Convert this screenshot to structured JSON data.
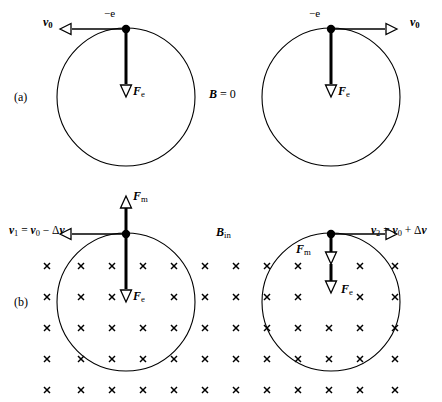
{
  "figure": {
    "width": 442,
    "height": 402,
    "background": "#ffffff",
    "stroke": "#000000",
    "panels": [
      {
        "tag": "(a)",
        "field_label": "B = 0",
        "description": "No magnetic field; electron orbits with speed v0 under electric force Fe only."
      },
      {
        "tag": "(b)",
        "field_label": "B_in",
        "description": "Magnetic field into the page; magnetic force Fm adds to or subtracts from the electric force Fe, changing the orbital speed."
      }
    ]
  },
  "labels": {
    "panel_a_tag": "(a)",
    "panel_b_tag": "(b)",
    "charge_left_a": "−e",
    "charge_right_a": "−e",
    "velocity_left_a": "v",
    "velocity_left_a_sub": "0",
    "velocity_right_a": "v",
    "velocity_right_a_sub": "0",
    "force_e_left_a": "F",
    "force_e_left_a_sub": "e",
    "force_e_right_a": "F",
    "force_e_right_a_sub": "e",
    "field_a": "B",
    "field_a_value": " = 0",
    "field_b": "B",
    "field_b_sub": "in",
    "force_m_left_b": "F",
    "force_m_left_b_sub": "m",
    "force_m_right_b": "F",
    "force_m_right_b_sub": "m",
    "force_e_left_b": "F",
    "force_e_left_b_sub": "e",
    "force_e_right_b": "F",
    "force_e_right_b_sub": "e",
    "velocity_left_b_name": "v",
    "velocity_left_b_sub": "1",
    "velocity_left_b_rhs": " = ",
    "velocity_left_b_v0": "v",
    "velocity_left_b_v0_sub": "0",
    "velocity_left_b_op": " − Δ",
    "velocity_left_b_dv": "v",
    "velocity_right_b_name": "v",
    "velocity_right_b_sub": "2",
    "velocity_right_b_rhs": " = ",
    "velocity_right_b_v0": "v",
    "velocity_right_b_v0_sub": "0",
    "velocity_right_b_op": " + Δ",
    "velocity_right_b_dv": "v",
    "field_cross_glyph": "×"
  },
  "geometry": {
    "circle_a_left": {
      "cx": 126,
      "cy": 97,
      "r": 69
    },
    "circle_a_right": {
      "cx": 331,
      "cy": 97,
      "r": 69
    },
    "circle_b_left": {
      "cx": 126,
      "cy": 302,
      "r": 69
    },
    "circle_b_right": {
      "cx": 331,
      "cy": 302,
      "r": 69
    },
    "cross_rows_y": [
      266,
      297,
      328,
      359,
      390
    ],
    "cross_cols_x": [
      47,
      81,
      112,
      143,
      174,
      205,
      236,
      267,
      298,
      329,
      360,
      391
    ],
    "cross_size": 6
  },
  "colors": {
    "ink": "#000000",
    "paper": "#ffffff"
  }
}
